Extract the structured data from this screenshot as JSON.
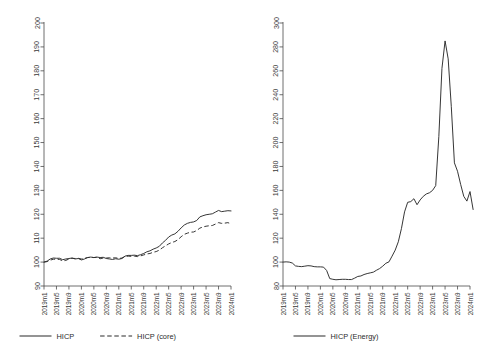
{
  "figure": {
    "panels": [
      "hicp-panel",
      "energy-panel"
    ],
    "line_color": "#2b2b2b",
    "axis_color": "#4a4a4a",
    "background": "#ffffff"
  },
  "chart_data": [
    {
      "id": "hicp-panel",
      "type": "line",
      "title": "",
      "xlabel": "",
      "ylabel": "",
      "ylim": [
        90,
        200
      ],
      "yticks": [
        90,
        100,
        110,
        120,
        130,
        140,
        150,
        160,
        170,
        180,
        190,
        200
      ],
      "grid": false,
      "legend_position": "bottom",
      "xticks": [
        "2019m1",
        "2019m5",
        "2019m9",
        "2020m1",
        "2020m5",
        "2020m9",
        "2021m1",
        "2021m5",
        "2021m9",
        "2022m1",
        "2022m5",
        "2022m9",
        "2023m1",
        "2023m5",
        "2023m9",
        "2024m1"
      ],
      "x_start": "2019m1",
      "x_end": "2024m1",
      "n_points": 61,
      "series": [
        {
          "name": "HICP",
          "style": "solid",
          "values": [
            100.0,
            100.4,
            101.3,
            101.7,
            101.6,
            101.6,
            101.0,
            101.3,
            101.5,
            101.7,
            101.3,
            101.5,
            100.9,
            101.3,
            101.9,
            102.1,
            101.9,
            102.1,
            101.9,
            102.0,
            101.5,
            101.3,
            101.1,
            101.4,
            101.2,
            101.5,
            102.5,
            102.8,
            102.8,
            102.9,
            102.7,
            103.1,
            103.6,
            104.3,
            104.7,
            105.4,
            105.9,
            106.6,
            108.0,
            109.1,
            110.5,
            111.3,
            111.8,
            112.9,
            114.3,
            115.5,
            116.2,
            116.6,
            116.8,
            117.4,
            118.9,
            119.4,
            119.8,
            120.0,
            120.2,
            120.9,
            121.6,
            121.1,
            121.3,
            121.5,
            121.4
          ]
        },
        {
          "name": "HICP (core)",
          "style": "dashed",
          "values": [
            100.0,
            100.2,
            100.8,
            101.2,
            101.2,
            101.1,
            100.5,
            100.7,
            101.3,
            101.6,
            101.5,
            101.6,
            101.3,
            101.6,
            101.9,
            102.0,
            101.9,
            102.0,
            101.4,
            101.7,
            101.7,
            101.8,
            101.7,
            101.8,
            101.5,
            101.7,
            102.3,
            102.5,
            102.4,
            102.5,
            102.3,
            102.6,
            103.0,
            103.4,
            103.6,
            104.1,
            104.4,
            105.0,
            106.0,
            106.8,
            107.6,
            108.2,
            108.6,
            109.4,
            110.6,
            111.6,
            112.1,
            112.5,
            112.6,
            113.2,
            114.2,
            114.7,
            115.0,
            115.2,
            115.3,
            115.9,
            116.5,
            116.2,
            116.3,
            116.5,
            116.0
          ]
        }
      ]
    },
    {
      "id": "energy-panel",
      "type": "line",
      "title": "",
      "xlabel": "",
      "ylabel": "",
      "ylim": [
        80,
        300
      ],
      "yticks": [
        80,
        100,
        120,
        140,
        160,
        180,
        200,
        220,
        240,
        260,
        280,
        300
      ],
      "grid": false,
      "legend_position": "bottom",
      "xticks": [
        "2019m1",
        "2019m5",
        "2019m9",
        "2020m1",
        "2020m5",
        "2020m9",
        "2021m1",
        "2021m5",
        "2021m9",
        "2022m1",
        "2022m5",
        "2022m9",
        "2023m1",
        "2023m5",
        "2023m9",
        "2024m1"
      ],
      "x_start": "2019m1",
      "x_end": "2024m1",
      "n_points": 61,
      "series": [
        {
          "name": "HICP (Energy)",
          "style": "solid",
          "values": [
            100.0,
            100.2,
            100.0,
            99.2,
            96.8,
            96.4,
            96.2,
            96.6,
            97.0,
            96.8,
            96.2,
            96.0,
            96.0,
            95.8,
            93.0,
            86.2,
            85.6,
            85.2,
            85.4,
            85.6,
            85.6,
            85.4,
            85.4,
            86.6,
            88.0,
            88.4,
            89.6,
            90.4,
            91.0,
            91.6,
            93.2,
            94.6,
            96.6,
            99.0,
            100.2,
            105.0,
            110.0,
            117.0,
            128.0,
            142.0,
            150.0,
            150.6,
            153.0,
            148.0,
            152.0,
            155.0,
            157.0,
            158.0,
            160.0,
            164.0,
            205.0,
            262.0,
            285.0,
            270.0,
            230.0,
            183.0,
            176.0,
            165.0,
            155.0,
            151.0,
            159.0,
            144.0
          ]
        }
      ]
    }
  ],
  "legends": [
    {
      "panel": "hicp-panel",
      "entries": [
        {
          "label": "HICP",
          "style": "solid"
        },
        {
          "label": "HICP (core)",
          "style": "dashed"
        }
      ]
    },
    {
      "panel": "energy-panel",
      "entries": [
        {
          "label": "HICP (Energy)",
          "style": "solid"
        }
      ]
    }
  ]
}
